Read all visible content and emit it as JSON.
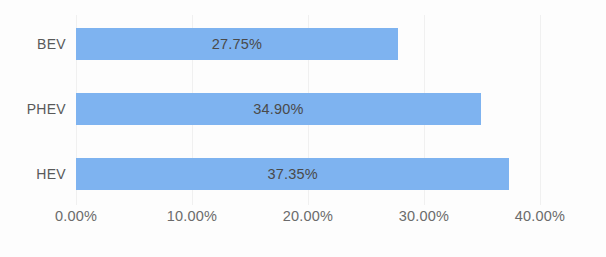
{
  "chart_data": {
    "type": "bar",
    "orientation": "horizontal",
    "title": "",
    "subtitle": "",
    "xlabel": "",
    "ylabel": "",
    "categories": [
      "BEV",
      "PHEV",
      "HEV"
    ],
    "values": [
      27.75,
      34.9,
      37.35
    ],
    "value_labels": [
      "27.75%",
      "34.90%",
      "37.35%"
    ],
    "xlim": [
      0,
      40
    ],
    "xticks": [
      0,
      10,
      20,
      30,
      40
    ],
    "xtick_labels": [
      "0.00%",
      "10.00%",
      "20.00%",
      "30.00%",
      "40.00%"
    ],
    "grid": true,
    "grid_axis": "x",
    "legend": false,
    "legend_position": "none",
    "series": [
      {
        "name": "",
        "color": "#7eb3f0",
        "values": [
          27.75,
          34.9,
          37.35
        ]
      }
    ]
  },
  "colors": {
    "bar": "#7eb3f0",
    "background": "#fdfdfd",
    "gridline": "#f0f0f0",
    "category_text": "#595959",
    "tick_text": "#6b6b6b",
    "value_text": "#4a4a4a"
  }
}
